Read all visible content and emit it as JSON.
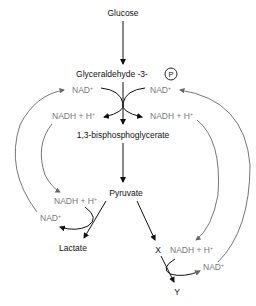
{
  "diagram": {
    "nodes": {
      "glucose": "Glucose",
      "g3p": "Glyceraldehyde -3-",
      "phosphate": "P",
      "bpg": "1,3-bisphosphoglycerate",
      "pyruvate": "Pyruvate",
      "lactate": "Lactate",
      "x": "X",
      "y": "Y"
    },
    "cofactors": {
      "nad_left_top": "NAD",
      "nad_right_top": "NAD",
      "nadh_left_top": "NADH + H",
      "nadh_right_top": "NADH + H",
      "nadh_left_bottom": "NADH + H",
      "nad_left_bottom": "NAD",
      "nadh_right_bottom": "NADH + H",
      "nad_right_bottom": "NAD",
      "plus": "+"
    },
    "colors": {
      "main_arrow": "#111111",
      "cofactor_text": "#777777",
      "cycle_arrow": "#666666"
    }
  }
}
